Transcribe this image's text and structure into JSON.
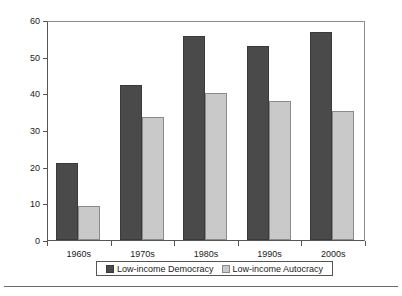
{
  "chart_data": {
    "type": "bar",
    "title": "",
    "xlabel": "",
    "ylabel": "% of School-Age Population",
    "categories": [
      "1960s",
      "1970s",
      "1980s",
      "1990s",
      "2000s"
    ],
    "series": [
      {
        "name": "Low-income Democracy",
        "color": "#4a4a4a",
        "values": [
          21,
          42.3,
          55.7,
          53,
          56.7
        ]
      },
      {
        "name": "Low-income Autocracy",
        "color": "#c9c9c9",
        "values": [
          9.2,
          33.5,
          40,
          38,
          35.3
        ]
      }
    ],
    "ylim": [
      0,
      60
    ],
    "ytick_labels": [
      "0",
      "10",
      "20",
      "30",
      "40",
      "50",
      "60"
    ],
    "ytick_values": [
      0,
      10,
      20,
      30,
      40,
      50,
      60
    ],
    "grid": false,
    "legend_position": "bottom"
  }
}
